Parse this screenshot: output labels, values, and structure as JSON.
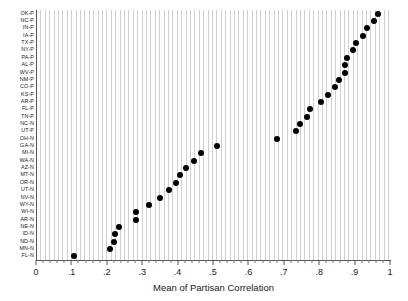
{
  "chart_data": {
    "type": "scatter",
    "title": "",
    "xlabel": "Mean of Partisan Correlation",
    "ylabel": "",
    "xlim": [
      0,
      1
    ],
    "ylim_categories_top_to_bottom": true,
    "grid": true,
    "legend": null,
    "xticklabels": [
      "0",
      ".1",
      ".2",
      ".3",
      ".4",
      ".5",
      ".6",
      ".7",
      ".8",
      ".9",
      "1"
    ],
    "xtickvalues": [
      0,
      0.1,
      0.2,
      0.3,
      0.4,
      0.5,
      0.6,
      0.7,
      0.8,
      0.9,
      1
    ],
    "minor_tick_step": 0.02,
    "categories": [
      "OK-P",
      "NC-P",
      "IN-P",
      "IA-P",
      "TX-P",
      "NY-P",
      "PA-P",
      "AL-P",
      "WV-P",
      "NM-P",
      "CO-P",
      "KS-P",
      "AR-P",
      "FL-P",
      "TN-P",
      "NC-N",
      "UT-P",
      "OH-N",
      "GA-N",
      "MI-N",
      "WA-N",
      "AZ-N",
      "MT-N",
      "OR-N",
      "UT-N",
      "NV-N",
      "WY-N",
      "WI-N",
      "AR-N",
      "NE-N",
      "ID-N",
      "ND-N",
      "MN-N",
      "FL-N"
    ],
    "values": [
      0.965,
      0.955,
      0.935,
      0.925,
      0.905,
      0.895,
      0.878,
      0.874,
      0.873,
      0.855,
      0.845,
      0.825,
      0.805,
      0.775,
      0.765,
      0.745,
      0.735,
      0.68,
      0.51,
      0.465,
      0.445,
      0.425,
      0.408,
      0.395,
      0.375,
      0.35,
      0.32,
      0.283,
      0.282,
      0.235,
      0.222,
      0.22,
      0.21,
      0.107
    ],
    "marker": "filled-circle",
    "marker_color": "#000000",
    "point_count": 34
  }
}
